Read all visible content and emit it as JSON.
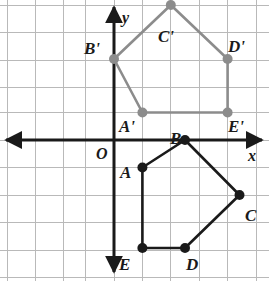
{
  "figure": {
    "type": "coordinate-geometry-diagram",
    "background_color": "#ffffff"
  },
  "grid": {
    "visible": true,
    "line_color": "#b9b9b9",
    "cell_width_px": 28.4,
    "cell_height_px": 27.5,
    "origin_px": {
      "x": 114,
      "y": 140
    },
    "x_lines_px": [
      7,
      35.4,
      63.8,
      85.6,
      114,
      142.4,
      170.8,
      199.2,
      227.6,
      256
    ],
    "y_lines_px": [
      5,
      32.5,
      60,
      87.5,
      112.5,
      140,
      167.5,
      195,
      222.5,
      250,
      277.5
    ]
  },
  "axes": {
    "x_axis": {
      "label": "x",
      "color": "#1a1a1a",
      "y_px": 140,
      "x_start_px": 6,
      "x_end_px": 262,
      "arrow_start": true,
      "arrow_end": true,
      "label_pos_px": {
        "x": 248,
        "y": 148
      }
    },
    "y_axis": {
      "label": "y",
      "color": "#1a1a1a",
      "x_px": 114,
      "y_start_px": 7,
      "y_end_px": 272,
      "arrow_start": true,
      "arrow_end": true,
      "label_pos_px": {
        "x": 122,
        "y": 10
      }
    },
    "origin": {
      "label": "O",
      "label_pos_px": {
        "x": 96,
        "y": 146
      }
    }
  },
  "shapes": [
    {
      "name": "pentagon-preimage",
      "id": "preimage",
      "label": "ABCDE",
      "stroke_color": "#1a1a1a",
      "stroke_width": 2.6,
      "vertex_color": "#1a1a1a",
      "vertex_radius": 5,
      "closed": true,
      "vertices": [
        {
          "name": "A",
          "grid": [
            1,
            -1
          ],
          "px": [
            142.4,
            167.5
          ],
          "label_pos_px": [
            120,
            164
          ]
        },
        {
          "name": "B",
          "grid": [
            2.5,
            0
          ],
          "px": [
            185,
            140
          ],
          "label_pos_px": [
            170,
            130
          ]
        },
        {
          "name": "C",
          "grid": [
            4.4,
            -2
          ],
          "px": [
            239.5,
            195
          ],
          "label_pos_px": [
            245,
            207
          ]
        },
        {
          "name": "D",
          "grid": [
            2.5,
            -4
          ],
          "px": [
            185,
            248
          ],
          "label_pos_px": [
            186,
            256
          ]
        },
        {
          "name": "E",
          "grid": [
            1,
            -4
          ],
          "px": [
            142.4,
            248
          ],
          "label_pos_px": [
            119,
            256
          ]
        }
      ]
    },
    {
      "name": "pentagon-image",
      "id": "image",
      "label": "A'B'C'D'E'",
      "stroke_color": "#8c8c8c",
      "stroke_width": 2.6,
      "vertex_color": "#8c8c8c",
      "vertex_radius": 5,
      "closed": true,
      "vertices": [
        {
          "name": "A'",
          "grid": [
            1,
            1
          ],
          "px": [
            142.4,
            112.5
          ],
          "label_pos_px": [
            119,
            118
          ]
        },
        {
          "name": "B'",
          "grid": [
            0,
            3
          ],
          "px": [
            114,
            59
          ],
          "label_pos_px": [
            84,
            40
          ]
        },
        {
          "name": "C'",
          "grid": [
            2,
            5
          ],
          "px": [
            170.8,
            5
          ],
          "label_pos_px": [
            158,
            28
          ]
        },
        {
          "name": "D'",
          "grid": [
            4,
            3
          ],
          "px": [
            227.6,
            59
          ],
          "label_pos_px": [
            228,
            38
          ]
        },
        {
          "name": "E'",
          "grid": [
            4,
            1
          ],
          "px": [
            227.6,
            112.5
          ],
          "label_pos_px": [
            228,
            118
          ]
        }
      ]
    }
  ],
  "labels": {
    "A": "A",
    "B": "B",
    "C": "C",
    "D": "D",
    "E": "E",
    "A_prime": "A′",
    "B_prime": "B′",
    "C_prime": "C′",
    "D_prime": "D′",
    "E_prime": "E′",
    "origin": "O",
    "x_axis": "x",
    "y_axis": "y"
  }
}
